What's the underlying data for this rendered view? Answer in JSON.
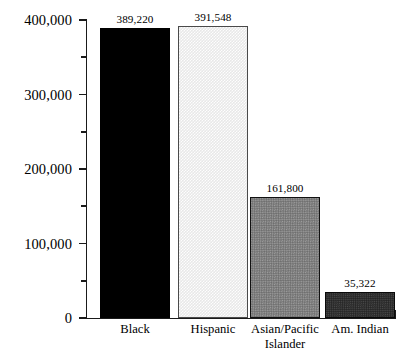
{
  "chart_data": {
    "type": "bar",
    "title": "",
    "subtitle": "",
    "xlabel": "",
    "ylabel": "",
    "categories": [
      "Black",
      "Hispanic",
      "Asian/Pacific Islander",
      "Am. Indian"
    ],
    "category_lines": [
      [
        "Black"
      ],
      [
        "Hispanic"
      ],
      [
        "Asian/Pacific",
        "Islander"
      ],
      [
        "Am. Indian"
      ]
    ],
    "values": [
      389220,
      391548,
      161800,
      35322
    ],
    "value_labels": [
      "389,220",
      "391,548",
      "161,800",
      "35,322"
    ],
    "ylim": [
      0,
      400000
    ],
    "ytick_values": [
      0,
      50000,
      100000,
      150000,
      200000,
      250000,
      300000,
      350000,
      400000
    ],
    "ytick_labels": [
      "0",
      "",
      "100,000",
      "",
      "200,000",
      "",
      "300,000",
      "",
      "400,000"
    ],
    "major_ticks": [
      0,
      100000,
      200000,
      300000,
      400000
    ],
    "minor_ticks": [
      50000,
      150000,
      250000,
      350000
    ],
    "grid": false,
    "legend": null,
    "bar_styles": [
      {
        "name": "solid-black",
        "fill": "#000000",
        "edge": "#000000"
      },
      {
        "name": "light-gray",
        "fill": "#e8e8e8",
        "edge": "#4a4a4a"
      },
      {
        "name": "medium-gray-dither",
        "fill": "#7e7e7e",
        "edge": "#111111"
      },
      {
        "name": "dark-gray-dither",
        "fill": "#2f2f2f",
        "edge": "#0a0a0a"
      }
    ],
    "axis_color": "#1a1a1a",
    "background": "#ffffff"
  }
}
